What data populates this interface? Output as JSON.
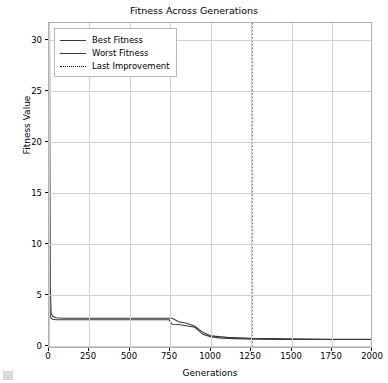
{
  "chart_data": {
    "type": "line",
    "title": "Fitness Across Generations",
    "xlabel": "Generations",
    "ylabel": "Fitness Value",
    "xlim": [
      0,
      2000
    ],
    "ylim": [
      0,
      32
    ],
    "grid": true,
    "legend_position": "upper left",
    "xticks": [
      "0",
      "250",
      "500",
      "750",
      "1000",
      "1250",
      "1500",
      "1750",
      "2000"
    ],
    "yticks": [
      "0",
      "5",
      "10",
      "15",
      "20",
      "25",
      "30"
    ],
    "series": [
      {
        "name": "Best Fitness",
        "color": "#3a3a3a",
        "style": "solid",
        "x": [
          0,
          5,
          10,
          15,
          20,
          30,
          40,
          60,
          100,
          200,
          400,
          600,
          700,
          740,
          760,
          800,
          900,
          950,
          1000,
          1050,
          1100,
          1200,
          1400,
          1600,
          1800,
          2000
        ],
        "y": [
          4.6,
          3.1,
          2.9,
          2.85,
          2.8,
          2.78,
          2.75,
          2.75,
          2.75,
          2.75,
          2.75,
          2.75,
          2.75,
          2.75,
          2.3,
          2.28,
          2.0,
          1.3,
          1.05,
          0.95,
          0.9,
          0.85,
          0.8,
          0.8,
          0.8,
          0.8
        ]
      },
      {
        "name": "Worst Fitness",
        "color": "#3a3a3a",
        "style": "solid",
        "x": [
          0,
          5,
          10,
          20,
          40,
          80,
          200,
          500,
          700,
          760,
          800,
          850,
          900,
          950,
          1000,
          1100,
          1250,
          1500,
          1750,
          2000
        ],
        "y": [
          31.5,
          6.0,
          3.4,
          3.1,
          2.95,
          2.9,
          2.9,
          2.9,
          2.9,
          2.9,
          2.55,
          2.4,
          2.1,
          1.5,
          1.15,
          1.0,
          0.9,
          0.85,
          0.82,
          0.8
        ]
      }
    ],
    "annotations": [
      {
        "name": "Last Improvement",
        "type": "vline",
        "x": 1254,
        "style": "dotted",
        "color": "#000000"
      }
    ]
  },
  "legend": {
    "items": [
      {
        "label": "Best Fitness",
        "style": "solid"
      },
      {
        "label": "Worst Fitness",
        "style": "solid"
      },
      {
        "label": "Last Improvement",
        "style": "dotted"
      }
    ]
  }
}
